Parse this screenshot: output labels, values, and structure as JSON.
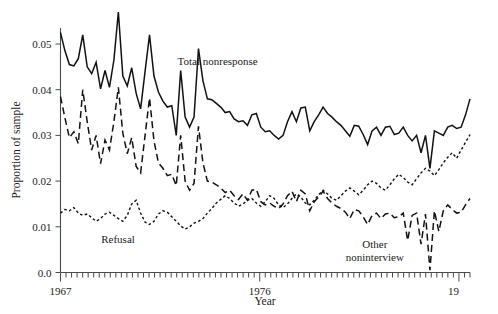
{
  "figure": {
    "background": "#ffffff",
    "ink_color": "#111111"
  },
  "chart_data": {
    "type": "line",
    "title": "",
    "xlabel": "Year",
    "ylabel": "Proportion of sample",
    "xlim": [
      1967,
      1985.5
    ],
    "ylim": [
      0.0,
      0.057
    ],
    "grid": false,
    "legend": "inline-annotations",
    "ytick_labels": [
      "0.0",
      "0.01",
      "0.02",
      "0.03",
      "0.04",
      "0.05"
    ],
    "ytick_values": [
      0.0,
      0.01,
      0.02,
      0.03,
      0.04,
      0.05
    ],
    "xtick_labels": [
      "1967",
      "1976",
      "19"
    ],
    "xtick_values": [
      1967,
      1976,
      1985
    ],
    "x_minor_tick_interval": 0.25,
    "x_note": "monthly/quarterly observations from 1967 through about 1985; right-most year label is clipped at the figure edge",
    "annotations": [
      {
        "text": "Total nonresponse",
        "x": 1974.1,
        "y": 0.0455,
        "series": "total_nonresponse"
      },
      {
        "text": "Refusal",
        "x": 1969.6,
        "y": 0.0065,
        "series": "refusal"
      },
      {
        "text": "Other noninterview",
        "x": 1981.2,
        "y": 0.0053,
        "series": "other_noninterview"
      }
    ],
    "series": [
      {
        "name": "Total nonresponse",
        "style": "solid",
        "values": [
          0.0525,
          0.0485,
          0.0455,
          0.0452,
          0.0468,
          0.052,
          0.045,
          0.0435,
          0.046,
          0.0402,
          0.0442,
          0.0405,
          0.0465,
          0.057,
          0.043,
          0.0408,
          0.0448,
          0.0392,
          0.0358,
          0.044,
          0.052,
          0.043,
          0.0395,
          0.0375,
          0.0362,
          0.0365,
          0.03,
          0.0442,
          0.034,
          0.0318,
          0.034,
          0.049,
          0.042,
          0.038,
          0.0378,
          0.037,
          0.0362,
          0.035,
          0.0352,
          0.0336,
          0.033,
          0.0332,
          0.0322,
          0.0345,
          0.0348,
          0.0318,
          0.0308,
          0.031,
          0.03,
          0.0292,
          0.03,
          0.033,
          0.0352,
          0.033,
          0.036,
          0.0362,
          0.031,
          0.033,
          0.0345,
          0.0362,
          0.0348,
          0.034,
          0.033,
          0.0322,
          0.031,
          0.0298,
          0.0322,
          0.032,
          0.0302,
          0.028,
          0.031,
          0.0318,
          0.03,
          0.0318,
          0.032,
          0.0302,
          0.0305,
          0.0318,
          0.03,
          0.0288,
          0.03,
          0.0262,
          0.03,
          0.0228,
          0.031,
          0.0305,
          0.03,
          0.0318,
          0.0322,
          0.0315,
          0.0318,
          0.0345,
          0.038
        ]
      },
      {
        "name": "Other noninterview",
        "style": "long-dash",
        "values": [
          0.0385,
          0.0338,
          0.0295,
          0.0308,
          0.0282,
          0.04,
          0.033,
          0.0268,
          0.03,
          0.0238,
          0.029,
          0.0268,
          0.033,
          0.0405,
          0.0305,
          0.026,
          0.0295,
          0.0232,
          0.0218,
          0.03,
          0.0382,
          0.0288,
          0.024,
          0.0228,
          0.0212,
          0.0215,
          0.019,
          0.03,
          0.02,
          0.018,
          0.0195,
          0.032,
          0.024,
          0.02,
          0.0198,
          0.0192,
          0.0185,
          0.0175,
          0.018,
          0.0168,
          0.016,
          0.0172,
          0.0158,
          0.018,
          0.0182,
          0.0155,
          0.0148,
          0.0152,
          0.0145,
          0.014,
          0.015,
          0.0168,
          0.0178,
          0.0155,
          0.018,
          0.0172,
          0.0135,
          0.0155,
          0.0165,
          0.0178,
          0.0162,
          0.0152,
          0.0145,
          0.014,
          0.0132,
          0.0118,
          0.0138,
          0.0135,
          0.0122,
          0.0105,
          0.0125,
          0.013,
          0.0118,
          0.0128,
          0.013,
          0.012,
          0.0122,
          0.013,
          0.007,
          0.0125,
          0.013,
          0.0062,
          0.0128,
          0.0005,
          0.0135,
          0.009,
          0.0135,
          0.0148,
          0.0138,
          0.013,
          0.0132,
          0.0148,
          0.0162
        ]
      },
      {
        "name": "Refusal",
        "style": "short-dash",
        "values": [
          0.013,
          0.0138,
          0.0135,
          0.0142,
          0.013,
          0.0125,
          0.0128,
          0.012,
          0.0112,
          0.0118,
          0.0128,
          0.0132,
          0.0125,
          0.0118,
          0.0112,
          0.0125,
          0.015,
          0.0158,
          0.013,
          0.011,
          0.0105,
          0.0112,
          0.0128,
          0.0135,
          0.0132,
          0.0122,
          0.0112,
          0.0102,
          0.0095,
          0.01,
          0.0108,
          0.0112,
          0.0118,
          0.013,
          0.014,
          0.0152,
          0.016,
          0.0168,
          0.0162,
          0.0152,
          0.0145,
          0.015,
          0.0158,
          0.0162,
          0.0152,
          0.0145,
          0.0155,
          0.0168,
          0.0162,
          0.0148,
          0.0142,
          0.015,
          0.0162,
          0.0172,
          0.0165,
          0.0152,
          0.0148,
          0.0158,
          0.017,
          0.018,
          0.0172,
          0.0162,
          0.0158,
          0.0168,
          0.0178,
          0.0185,
          0.0178,
          0.017,
          0.018,
          0.0192,
          0.02,
          0.0195,
          0.0185,
          0.018,
          0.0192,
          0.0205,
          0.0215,
          0.0208,
          0.0198,
          0.0192,
          0.0205,
          0.0218,
          0.0228,
          0.0222,
          0.0212,
          0.0225,
          0.024,
          0.0252,
          0.0262,
          0.025,
          0.0268,
          0.0285,
          0.0302
        ]
      }
    ]
  }
}
